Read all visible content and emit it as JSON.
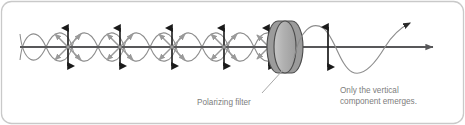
{
  "figure": {
    "panel": {
      "border_color": "#c9c9c9",
      "background_color": "#ffffff",
      "corner_radius": 10
    },
    "axis": {
      "name": "propagation-axis",
      "color": "#58585a",
      "y": 47,
      "x_start": 20,
      "x_end": 437,
      "arrowhead": "right"
    },
    "incoming_light": {
      "description": "Unpolarized light with vibrations in all directions",
      "wave_color": "#8d8d8d",
      "wave_count": 2,
      "amplitude": 23,
      "wavelength": 52,
      "x_start": 20,
      "x_end": 290
    },
    "vibration_clusters": {
      "count": 5,
      "vertical_arrow_color": "#1a1a1a",
      "diagonal_arrow_color": "#9a9a9a",
      "x_positions": [
        68,
        120,
        172,
        224,
        276
      ]
    },
    "filter": {
      "name": "polarizing-filter",
      "label": "Polarizing filter",
      "face_color": "#b3b3b3",
      "edge_color": "#8a8a8a",
      "outline_color": "#4d4d4d",
      "center_x": 285,
      "center_y": 47,
      "radius_x": 11,
      "radius_y": 26
    },
    "outgoing_light": {
      "description": "Vertically polarized light",
      "wave_color": "#8d8d8d",
      "arrow_color": "#1a1a1a",
      "x_start": 296,
      "x_end": 420
    },
    "labels": [
      {
        "name": "polarizing-filter-label",
        "text": "Polarizing filter",
        "x": 197,
        "y": 105,
        "color": "#7d7d7d",
        "leader_line": true
      },
      {
        "name": "vertical-component-label",
        "line1": "Only the vertical",
        "line2": "component emerges.",
        "x": 340,
        "y": 93,
        "color": "#7d7d7d",
        "leader_line": false
      }
    ]
  }
}
